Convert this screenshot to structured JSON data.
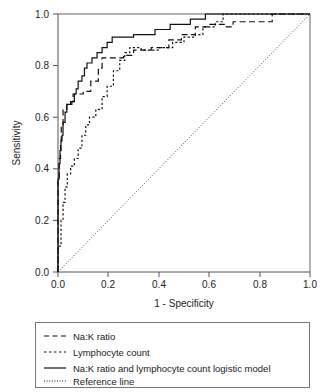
{
  "chart_data": {
    "type": "line",
    "title": "",
    "xlabel": "1 - Specificity",
    "ylabel": "Sensitivity",
    "xlim": [
      0.0,
      1.0
    ],
    "ylim": [
      0.0,
      1.0
    ],
    "xticks": [
      "0.0",
      "0.2",
      "0.4",
      "0.6",
      "0.8",
      "1.0"
    ],
    "xtick_values": [
      0.0,
      0.2,
      0.4,
      0.6,
      0.8,
      1.0
    ],
    "yticks": [
      "0.0",
      "0.2",
      "0.4",
      "0.6",
      "0.8",
      "1.0"
    ],
    "ytick_values": [
      0.0,
      0.2,
      0.4,
      0.6,
      0.8,
      1.0
    ],
    "grid": false,
    "legend_position": "below-plot",
    "series": [
      {
        "name": "Na:K ratio",
        "style": "dashed",
        "points": [
          [
            0.0,
            0.0
          ],
          [
            0.0,
            0.36
          ],
          [
            0.005,
            0.36
          ],
          [
            0.005,
            0.44
          ],
          [
            0.01,
            0.44
          ],
          [
            0.01,
            0.5
          ],
          [
            0.013,
            0.5
          ],
          [
            0.013,
            0.57
          ],
          [
            0.02,
            0.57
          ],
          [
            0.02,
            0.63
          ],
          [
            0.035,
            0.63
          ],
          [
            0.035,
            0.65
          ],
          [
            0.05,
            0.65
          ],
          [
            0.05,
            0.66
          ],
          [
            0.06,
            0.66
          ],
          [
            0.06,
            0.69
          ],
          [
            0.1,
            0.69
          ],
          [
            0.1,
            0.7
          ],
          [
            0.13,
            0.7
          ],
          [
            0.13,
            0.74
          ],
          [
            0.16,
            0.74
          ],
          [
            0.16,
            0.79
          ],
          [
            0.175,
            0.79
          ],
          [
            0.175,
            0.83
          ],
          [
            0.26,
            0.83
          ],
          [
            0.26,
            0.84
          ],
          [
            0.3,
            0.84
          ],
          [
            0.3,
            0.86
          ],
          [
            0.37,
            0.86
          ],
          [
            0.37,
            0.87
          ],
          [
            0.44,
            0.87
          ],
          [
            0.44,
            0.9
          ],
          [
            0.49,
            0.9
          ],
          [
            0.49,
            0.92
          ],
          [
            0.545,
            0.92
          ],
          [
            0.545,
            0.95
          ],
          [
            0.6,
            0.95
          ],
          [
            0.6,
            0.96
          ],
          [
            0.66,
            0.96
          ],
          [
            0.66,
            0.95
          ],
          [
            0.695,
            0.95
          ],
          [
            0.695,
            0.97
          ],
          [
            0.85,
            0.97
          ],
          [
            0.85,
            1.0
          ],
          [
            1.0,
            1.0
          ]
        ]
      },
      {
        "name": "Lymphocyte count",
        "style": "dotted",
        "points": [
          [
            0.0,
            0.0
          ],
          [
            0.0,
            0.1
          ],
          [
            0.012,
            0.1
          ],
          [
            0.012,
            0.2
          ],
          [
            0.02,
            0.2
          ],
          [
            0.02,
            0.27
          ],
          [
            0.028,
            0.27
          ],
          [
            0.028,
            0.33
          ],
          [
            0.037,
            0.33
          ],
          [
            0.037,
            0.38
          ],
          [
            0.05,
            0.38
          ],
          [
            0.05,
            0.41
          ],
          [
            0.065,
            0.41
          ],
          [
            0.065,
            0.44
          ],
          [
            0.08,
            0.44
          ],
          [
            0.08,
            0.48
          ],
          [
            0.095,
            0.48
          ],
          [
            0.095,
            0.53
          ],
          [
            0.11,
            0.53
          ],
          [
            0.11,
            0.57
          ],
          [
            0.125,
            0.57
          ],
          [
            0.125,
            0.6
          ],
          [
            0.15,
            0.6
          ],
          [
            0.15,
            0.63
          ],
          [
            0.175,
            0.63
          ],
          [
            0.175,
            0.68
          ],
          [
            0.195,
            0.68
          ],
          [
            0.195,
            0.72
          ],
          [
            0.22,
            0.72
          ],
          [
            0.22,
            0.78
          ],
          [
            0.245,
            0.78
          ],
          [
            0.245,
            0.82
          ],
          [
            0.265,
            0.82
          ],
          [
            0.265,
            0.85
          ],
          [
            0.285,
            0.85
          ],
          [
            0.285,
            0.87
          ],
          [
            0.33,
            0.87
          ],
          [
            0.33,
            0.86
          ],
          [
            0.4,
            0.86
          ],
          [
            0.4,
            0.87
          ],
          [
            0.455,
            0.87
          ],
          [
            0.455,
            0.89
          ],
          [
            0.5,
            0.89
          ],
          [
            0.5,
            0.91
          ],
          [
            0.545,
            0.91
          ],
          [
            0.545,
            0.92
          ],
          [
            0.575,
            0.92
          ],
          [
            0.575,
            0.95
          ],
          [
            0.625,
            0.95
          ],
          [
            0.625,
            0.97
          ],
          [
            0.655,
            0.97
          ],
          [
            0.655,
            1.0
          ],
          [
            1.0,
            1.0
          ]
        ]
      },
      {
        "name": "Na:K ratio and lymphocyte count logistic model",
        "style": "solid",
        "points": [
          [
            0.0,
            0.0
          ],
          [
            0.0,
            0.36
          ],
          [
            0.004,
            0.36
          ],
          [
            0.004,
            0.42
          ],
          [
            0.008,
            0.42
          ],
          [
            0.008,
            0.47
          ],
          [
            0.012,
            0.47
          ],
          [
            0.012,
            0.51
          ],
          [
            0.016,
            0.51
          ],
          [
            0.016,
            0.53
          ],
          [
            0.02,
            0.53
          ],
          [
            0.02,
            0.58
          ],
          [
            0.028,
            0.58
          ],
          [
            0.028,
            0.62
          ],
          [
            0.035,
            0.62
          ],
          [
            0.035,
            0.65
          ],
          [
            0.055,
            0.65
          ],
          [
            0.055,
            0.66
          ],
          [
            0.065,
            0.66
          ],
          [
            0.065,
            0.69
          ],
          [
            0.072,
            0.69
          ],
          [
            0.072,
            0.71
          ],
          [
            0.08,
            0.71
          ],
          [
            0.08,
            0.74
          ],
          [
            0.095,
            0.74
          ],
          [
            0.095,
            0.76
          ],
          [
            0.105,
            0.76
          ],
          [
            0.105,
            0.79
          ],
          [
            0.115,
            0.79
          ],
          [
            0.115,
            0.81
          ],
          [
            0.135,
            0.81
          ],
          [
            0.135,
            0.83
          ],
          [
            0.155,
            0.83
          ],
          [
            0.155,
            0.85
          ],
          [
            0.175,
            0.85
          ],
          [
            0.175,
            0.87
          ],
          [
            0.195,
            0.87
          ],
          [
            0.195,
            0.89
          ],
          [
            0.215,
            0.89
          ],
          [
            0.215,
            0.91
          ],
          [
            0.3,
            0.91
          ],
          [
            0.3,
            0.92
          ],
          [
            0.385,
            0.92
          ],
          [
            0.385,
            0.94
          ],
          [
            0.445,
            0.94
          ],
          [
            0.445,
            0.96
          ],
          [
            0.525,
            0.96
          ],
          [
            0.525,
            0.98
          ],
          [
            0.585,
            0.98
          ],
          [
            0.585,
            1.0
          ],
          [
            1.0,
            1.0
          ]
        ]
      },
      {
        "name": "Reference line",
        "style": "fine-dotted",
        "points": [
          [
            0.0,
            0.0
          ],
          [
            1.0,
            1.0
          ]
        ]
      }
    ]
  },
  "legend": {
    "items": [
      {
        "label": "Na:K ratio",
        "style": "dashed"
      },
      {
        "label": "Lymphocyte count",
        "style": "dotted"
      },
      {
        "label": "Na:K ratio and lymphocyte count logistic model",
        "style": "solid"
      },
      {
        "label": "Reference line",
        "style": "fine-dotted"
      }
    ]
  }
}
